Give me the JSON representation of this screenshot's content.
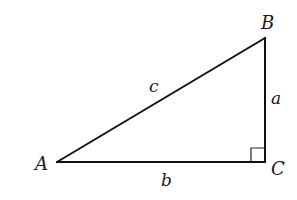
{
  "diagram": {
    "type": "right-triangle",
    "vertices": [
      {
        "id": "A",
        "label": "A"
      },
      {
        "id": "B",
        "label": "B"
      },
      {
        "id": "C",
        "label": "C"
      }
    ],
    "sides": [
      {
        "id": "a",
        "label": "a",
        "between": [
          "B",
          "C"
        ]
      },
      {
        "id": "b",
        "label": "b",
        "between": [
          "A",
          "C"
        ]
      },
      {
        "id": "c",
        "label": "c",
        "between": [
          "A",
          "B"
        ],
        "role": "hypotenuse"
      }
    ],
    "right_angle_at": "C",
    "colors": {
      "line": "#111111",
      "background": "#ffffff"
    }
  }
}
